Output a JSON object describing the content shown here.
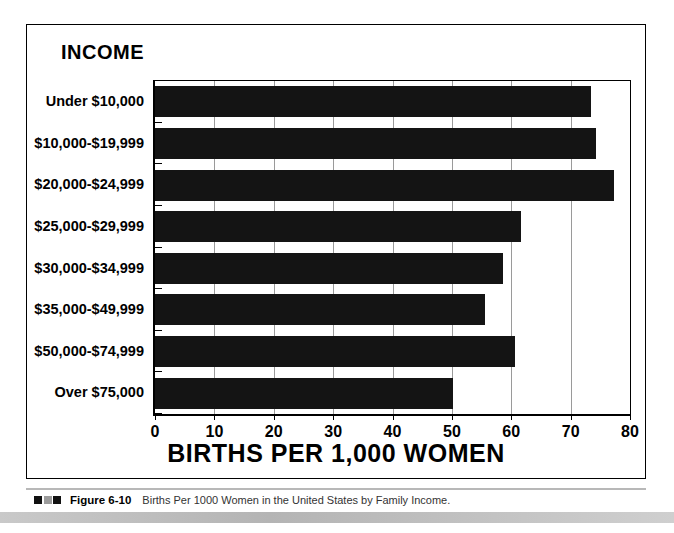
{
  "figure": {
    "panel_title": "INCOME",
    "caption_number": "Figure 6-10",
    "caption_text": "Births Per 1000 Women in the United States by Family Income."
  },
  "chart_data": {
    "type": "bar",
    "orientation": "horizontal",
    "title": "INCOME",
    "xlabel": "BIRTHS PER 1,000 WOMEN",
    "ylabel": "INCOME",
    "xlim": [
      0,
      80
    ],
    "xticks": [
      0,
      10,
      20,
      30,
      40,
      50,
      60,
      70,
      80
    ],
    "xtick_labels": [
      "0",
      "10",
      "20",
      "30",
      "40",
      "50",
      "60",
      "70",
      "80"
    ],
    "grid": true,
    "legend": "none",
    "categories": [
      "Under $10,000",
      "$10,000-$19,999",
      "$20,000-$24,999",
      "$25,000-$29,999",
      "$30,000-$34,999",
      "$35,000-$49,999",
      "$50,000-$74,999",
      "Over $75,000"
    ],
    "values": [
      73.5,
      74.2,
      77.3,
      61.6,
      58.6,
      55.5,
      60.6,
      50.2
    ],
    "bar_color": "#141414"
  }
}
